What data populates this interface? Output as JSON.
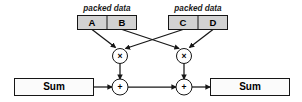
{
  "diagram": {
    "colors": {
      "packed_cell_fill": "#d2d2d2",
      "sum_box_fill": "#fbfbfb",
      "stroke": "#161616",
      "background": "#ffffff"
    },
    "packed_groups": [
      {
        "caption": "packed data",
        "cells": [
          {
            "label": "A"
          },
          {
            "label": "B"
          }
        ]
      },
      {
        "caption": "packed data",
        "cells": [
          {
            "label": "C"
          },
          {
            "label": "D"
          }
        ]
      }
    ],
    "operators": [
      {
        "id": "mul-left",
        "symbol": "×"
      },
      {
        "id": "mul-right",
        "symbol": "×"
      },
      {
        "id": "add-left",
        "symbol": "+"
      },
      {
        "id": "add-right",
        "symbol": "+"
      }
    ],
    "accumulators": [
      {
        "id": "sum-in",
        "label": "Sum"
      },
      {
        "id": "sum-out",
        "label": "Sum"
      }
    ],
    "edges": [
      {
        "from": "A",
        "to": "mul-left"
      },
      {
        "from": "B",
        "to": "mul-right"
      },
      {
        "from": "C",
        "to": "mul-left"
      },
      {
        "from": "D",
        "to": "mul-right"
      },
      {
        "from": "mul-left",
        "to": "add-left"
      },
      {
        "from": "mul-right",
        "to": "add-right"
      },
      {
        "from": "sum-in",
        "to": "add-left"
      },
      {
        "from": "add-left",
        "to": "add-right"
      },
      {
        "from": "add-right",
        "to": "sum-out"
      }
    ]
  }
}
